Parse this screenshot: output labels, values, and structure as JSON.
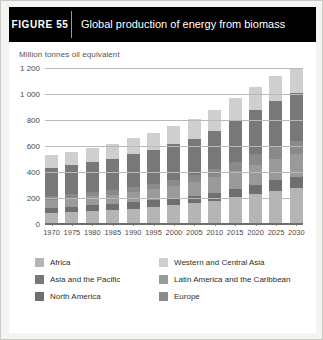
{
  "figure": {
    "number_label": "FIGURE  55",
    "title": "Global production of energy from biomass"
  },
  "chart_data": {
    "type": "bar",
    "stacked": true,
    "title": "Global production of energy from biomass",
    "subtitle": "Million tonnes oil equivalent",
    "xlabel": "",
    "ylabel": "Million tonnes oil equivalent",
    "unit": "Million tonnes oil equivalent",
    "ylim": [
      0,
      1200
    ],
    "yticks": [
      0,
      200,
      400,
      600,
      800,
      1000,
      1200
    ],
    "ytick_labels": [
      "0",
      "200",
      "400",
      "600",
      "800",
      "1 000",
      "1 200"
    ],
    "grid": true,
    "legend_position": "bottom",
    "categories": [
      "1970",
      "1975",
      "1980",
      "1985",
      "1990",
      "1995",
      "2000",
      "2005",
      "2010",
      "2015",
      "2020",
      "2025",
      "2030"
    ],
    "series": [
      {
        "name": "Africa",
        "color": "#b5b5b3",
        "values": [
          85,
          90,
          98,
          106,
          118,
          130,
          145,
          160,
          180,
          205,
          230,
          255,
          278
        ]
      },
      {
        "name": "North America",
        "color": "#6f6f6d",
        "values": [
          40,
          42,
          45,
          47,
          50,
          52,
          55,
          58,
          62,
          68,
          74,
          80,
          86
        ]
      },
      {
        "name": "Latin America and the Caribbean",
        "color": "#9a9a98",
        "values": [
          62,
          65,
          70,
          74,
          80,
          86,
          94,
          104,
          118,
          135,
          152,
          168,
          182
        ]
      },
      {
        "name": "Europe",
        "color": "#8a8a88",
        "values": [
          30,
          32,
          34,
          36,
          39,
          42,
          46,
          52,
          60,
          70,
          80,
          90,
          98
        ]
      },
      {
        "name": "Asia and the Pacific",
        "color": "#787876",
        "values": [
          215,
          222,
          230,
          240,
          252,
          262,
          272,
          284,
          298,
          318,
          338,
          356,
          372
        ],
        "note": "largest single region throughout the series"
      },
      {
        "name": "Western and Central Asia",
        "color": "#cfcfcd",
        "values": [
          98,
          104,
          110,
          116,
          124,
          132,
          140,
          150,
          160,
          170,
          180,
          190,
          198
        ]
      }
    ],
    "totals": [
      530,
      555,
      587,
      619,
      663,
      704,
      752,
      808,
      878,
      966,
      1054,
      1139,
      1214
    ],
    "totals_note": "Approximate column totals read from the stacked bars (Mtoe)."
  },
  "legend": {
    "items": [
      {
        "label": "Africa",
        "color": "#b5b5b3"
      },
      {
        "label": "Western and Central Asia",
        "color": "#cfcfcd"
      },
      {
        "label": "Asia and the Pacific",
        "color": "#787876"
      },
      {
        "label": "Latin America and the Caribbean",
        "color": "#9a9a98"
      },
      {
        "label": "North America",
        "color": "#6f6f6d"
      },
      {
        "label": "Europe",
        "color": "#8a8a88"
      }
    ]
  }
}
